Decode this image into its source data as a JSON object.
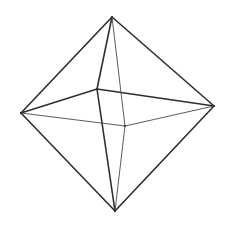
{
  "figure": {
    "shape": "octahedron",
    "stroke_color": "#2e2e2e",
    "background": "#ffffff",
    "vertices": [
      {
        "id": "top"
      },
      {
        "id": "bottom"
      },
      {
        "id": "left"
      },
      {
        "id": "right"
      },
      {
        "id": "back"
      },
      {
        "id": "front"
      }
    ],
    "edges": [
      {
        "from": "top",
        "to": "left",
        "weight": "strong"
      },
      {
        "from": "top",
        "to": "right",
        "weight": "strong"
      },
      {
        "from": "bottom",
        "to": "left",
        "weight": "strong"
      },
      {
        "from": "bottom",
        "to": "right",
        "weight": "strong"
      },
      {
        "from": "top",
        "to": "back",
        "weight": "strong"
      },
      {
        "from": "back",
        "to": "bottom",
        "weight": "strong"
      },
      {
        "from": "left",
        "to": "back",
        "weight": "strong"
      },
      {
        "from": "back",
        "to": "right",
        "weight": "strong"
      },
      {
        "from": "top",
        "to": "front",
        "weight": "light"
      },
      {
        "from": "front",
        "to": "bottom",
        "weight": "light"
      },
      {
        "from": "left",
        "to": "front",
        "weight": "light"
      },
      {
        "from": "front",
        "to": "right",
        "weight": "light"
      }
    ]
  }
}
